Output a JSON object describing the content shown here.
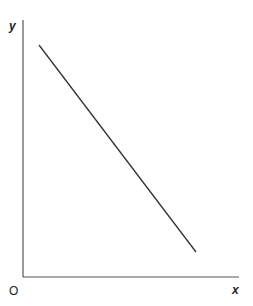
{
  "diagram": {
    "type": "line-graph",
    "axes": {
      "x_label": "x",
      "y_label": "y",
      "origin_label": "O"
    },
    "line": {
      "description": "straight line with negative slope",
      "start": {
        "x_px": 39,
        "y_px": 45
      },
      "end": {
        "x_px": 196,
        "y_px": 252
      }
    },
    "colors": {
      "axis": "#555555",
      "line": "#333333",
      "text": "#222222"
    }
  }
}
